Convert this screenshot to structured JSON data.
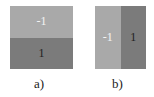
{
  "panels": [
    {
      "caption": "a)",
      "split": "horizontal",
      "regions": [
        {
          "position": "top",
          "value": "-1",
          "color": "#a9a9a9",
          "text_color": "#f4f4f4"
        },
        {
          "position": "bottom",
          "value": "1",
          "color": "#7b7b7b",
          "text_color": "#1e1e1e"
        }
      ]
    },
    {
      "caption": "b)",
      "split": "vertical",
      "regions": [
        {
          "position": "left",
          "value": "-1",
          "color": "#a9a9a9",
          "text_color": "#f4f4f4"
        },
        {
          "position": "right",
          "value": "1",
          "color": "#7b7b7b",
          "text_color": "#1e1e1e"
        }
      ]
    }
  ]
}
